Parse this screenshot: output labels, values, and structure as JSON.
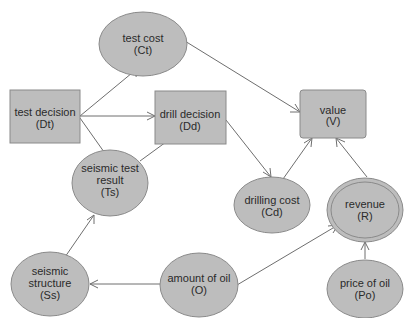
{
  "diagram": {
    "type": "influence-diagram",
    "colors": {
      "node_fill": "#bdbdbd",
      "node_stroke": "#8a8a8a",
      "edge": "#6e6e6e",
      "text": "#2a2a2a"
    },
    "nodes": {
      "test_cost": {
        "kind": "chance",
        "lines": [
          "test cost",
          "(Ct)"
        ]
      },
      "test_decision": {
        "kind": "decision",
        "lines": [
          "test decision",
          "(Dt)"
        ]
      },
      "drill_decision": {
        "kind": "decision",
        "lines": [
          "drill decision",
          "(Dd)"
        ]
      },
      "value": {
        "kind": "value",
        "lines": [
          "value",
          "(V)"
        ]
      },
      "seismic_test_result": {
        "kind": "chance",
        "lines": [
          "seismic test",
          "result",
          "(Ts)"
        ]
      },
      "drilling_cost": {
        "kind": "chance",
        "lines": [
          "drilling cost",
          "(Cd)"
        ]
      },
      "revenue": {
        "kind": "deterministic",
        "lines": [
          "revenue",
          "(R)"
        ]
      },
      "seismic_structure": {
        "kind": "chance",
        "lines": [
          "seismic",
          "structure",
          "(Ss)"
        ]
      },
      "amount_of_oil": {
        "kind": "chance",
        "lines": [
          "amount of oil",
          "(O)"
        ]
      },
      "price_of_oil": {
        "kind": "chance",
        "lines": [
          "price of oil",
          "(Po)"
        ]
      }
    },
    "edges": [
      [
        "Dt",
        "Ct"
      ],
      [
        "Dt",
        "Dd"
      ],
      [
        "Dt",
        "Ts"
      ],
      [
        "Ct",
        "V"
      ],
      [
        "Ts",
        "Dd"
      ],
      [
        "Dd",
        "Cd"
      ],
      [
        "Cd",
        "V"
      ],
      [
        "R",
        "V"
      ],
      [
        "Ss",
        "Ts"
      ],
      [
        "O",
        "Ss"
      ],
      [
        "O",
        "R"
      ],
      [
        "Po",
        "R"
      ]
    ]
  }
}
